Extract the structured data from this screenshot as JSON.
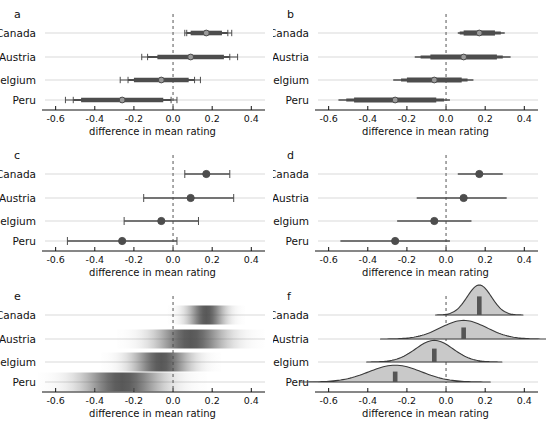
{
  "figure": {
    "width": 546,
    "height": 424,
    "background": "#ffffff",
    "ink": "#111111",
    "interval_color": "#4d4d4d",
    "grid_color": "#cfcfcf",
    "zero_line_color": "#555555",
    "density_fill": "#c9c9c9",
    "density_stroke": "#3a3a3a",
    "median_bar_color": "#555555",
    "gradient_color": "#4a4a4a"
  },
  "axis": {
    "label": "difference in mean rating",
    "ticks": [
      -0.6,
      -0.4,
      -0.2,
      0.0,
      0.2,
      0.4
    ],
    "tick_labels": [
      "-0.6",
      "-0.4",
      "-0.2",
      "0.0",
      "0.2",
      "0.4"
    ],
    "min": -0.68,
    "max": 0.47,
    "zero": 0.0
  },
  "groups": [
    "Canada",
    "Austria",
    "Belgium",
    "Peru"
  ],
  "panels": [
    {
      "letter": "a",
      "style": "multi-interval-capped",
      "caps": true
    },
    {
      "letter": "b",
      "style": "graduated-interval",
      "caps": false
    },
    {
      "letter": "c",
      "style": "single-interval-capped",
      "caps": true
    },
    {
      "letter": "d",
      "style": "single-interval",
      "caps": false
    },
    {
      "letter": "e",
      "style": "gradient-density"
    },
    {
      "letter": "f",
      "style": "ridgeline-density"
    }
  ],
  "chart_data": {
    "type": "scatter",
    "title": "",
    "xlabel": "difference in mean rating",
    "ylabel": "",
    "xlim": [
      -0.68,
      0.47
    ],
    "xticks": [
      -0.6,
      -0.4,
      -0.2,
      0.0,
      0.2,
      0.4
    ],
    "grid": true,
    "legend": "none",
    "categories": [
      "Canada",
      "Austria",
      "Belgium",
      "Peru"
    ],
    "estimates": [
      0.17,
      0.09,
      -0.06,
      -0.26
    ],
    "inner_50_ci": [
      [
        0.09,
        0.25
      ],
      [
        -0.08,
        0.26
      ],
      [
        -0.2,
        0.08
      ],
      [
        -0.47,
        -0.05
      ]
    ],
    "mid_80_ci": [
      [
        0.07,
        0.28
      ],
      [
        -0.13,
        0.29
      ],
      [
        -0.23,
        0.11
      ],
      [
        -0.51,
        -0.01
      ]
    ],
    "outer_95_ci": [
      [
        0.06,
        0.3
      ],
      [
        -0.16,
        0.33
      ],
      [
        -0.27,
        0.14
      ],
      [
        -0.55,
        0.02
      ]
    ],
    "single_ci": [
      [
        0.06,
        0.29
      ],
      [
        -0.15,
        0.31
      ],
      [
        -0.25,
        0.13
      ],
      [
        -0.54,
        0.02
      ]
    ],
    "density_sd": [
      0.062,
      0.118,
      0.096,
      0.135
    ],
    "density_peak_height": [
      1.0,
      0.62,
      0.72,
      0.56
    ],
    "annotations": [
      "Panels a-d show interval estimates of the same four contrasts.",
      "Panels e-f show the full posterior uncertainty as gradients and densities."
    ]
  }
}
